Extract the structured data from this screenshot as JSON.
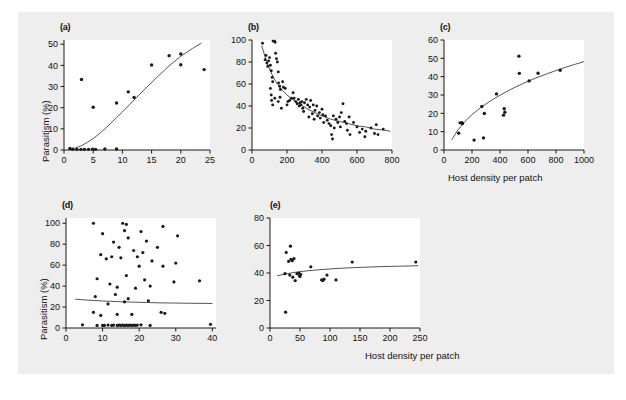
{
  "figure": {
    "background_color": "#eeeeee",
    "panel_background_color": "#ffffff",
    "point_color": "#1a1a1a",
    "curve_color": "#555555",
    "axis_color": "#1a1a1a",
    "shared_ylabel": "Parasitism (%)",
    "shared_xlabel": "Host density per patch"
  },
  "chart_data": [
    {
      "type": "scatter",
      "panel": "(a)",
      "title": "",
      "xlabel": "",
      "ylabel": "Parasitism (%)",
      "xlim": [
        0,
        25
      ],
      "ylim": [
        0,
        52
      ],
      "xticks": [
        0,
        5,
        10,
        15,
        20,
        25
      ],
      "yticks": [
        0,
        10,
        20,
        30,
        40,
        50
      ],
      "grid": false,
      "legend": "none",
      "points": [
        [
          1.0,
          0.7
        ],
        [
          1.5,
          0.4
        ],
        [
          2.2,
          0.3
        ],
        [
          2.9,
          0.3
        ],
        [
          3.5,
          0.3
        ],
        [
          4.2,
          0.3
        ],
        [
          4.9,
          0.4
        ],
        [
          5.4,
          0.3
        ],
        [
          7.0,
          0.5
        ],
        [
          9.0,
          0.5
        ],
        [
          3.0,
          33.3
        ],
        [
          5.0,
          20.2
        ],
        [
          9.0,
          22.2
        ],
        [
          11.0,
          27.5
        ],
        [
          12.0,
          24.8
        ],
        [
          15.0,
          40.2
        ],
        [
          18.0,
          44.6
        ],
        [
          20.0,
          45.4
        ],
        [
          20.0,
          40.3
        ],
        [
          24.0,
          38.0
        ]
      ],
      "fit_curve": [
        [
          1.0,
          0.4
        ],
        [
          2.0,
          1.0
        ],
        [
          3.0,
          2.1
        ],
        [
          4.0,
          3.6
        ],
        [
          5.0,
          5.4
        ],
        [
          6.0,
          7.6
        ],
        [
          7.0,
          10.0
        ],
        [
          8.0,
          12.6
        ],
        [
          9.0,
          15.3
        ],
        [
          10.0,
          18.0
        ],
        [
          12.0,
          23.6
        ],
        [
          14.0,
          29.2
        ],
        [
          16.0,
          34.6
        ],
        [
          18.0,
          39.8
        ],
        [
          20.0,
          44.3
        ],
        [
          22.0,
          48.0
        ],
        [
          23.5,
          50.5
        ]
      ]
    },
    {
      "type": "scatter",
      "panel": "(b)",
      "title": "",
      "xlabel": "",
      "ylabel": "",
      "xlim": [
        0,
        800
      ],
      "ylim": [
        0,
        100
      ],
      "xticks": [
        0,
        200,
        400,
        600,
        800
      ],
      "yticks": [
        0,
        20,
        40,
        60,
        80,
        100
      ],
      "grid": false,
      "legend": "none",
      "points": [
        [
          60,
          97
        ],
        [
          75,
          82
        ],
        [
          80,
          86
        ],
        [
          85,
          79
        ],
        [
          90,
          76
        ],
        [
          95,
          81
        ],
        [
          100,
          84
        ],
        [
          105,
          77
        ],
        [
          110,
          72
        ],
        [
          115,
          66
        ],
        [
          118,
          62
        ],
        [
          120,
          99
        ],
        [
          128,
          99
        ],
        [
          132,
          98
        ],
        [
          135,
          88
        ],
        [
          140,
          83
        ],
        [
          145,
          80
        ],
        [
          150,
          71
        ],
        [
          152,
          61
        ],
        [
          158,
          58
        ],
        [
          162,
          55
        ],
        [
          105,
          56
        ],
        [
          110,
          50
        ],
        [
          112,
          45
        ],
        [
          118,
          41
        ],
        [
          130,
          47
        ],
        [
          150,
          44
        ],
        [
          160,
          48
        ],
        [
          168,
          38
        ],
        [
          175,
          62
        ],
        [
          180,
          57
        ],
        [
          190,
          56
        ],
        [
          200,
          41
        ],
        [
          205,
          44
        ],
        [
          215,
          45
        ],
        [
          225,
          47
        ],
        [
          235,
          52
        ],
        [
          240,
          47
        ],
        [
          250,
          44
        ],
        [
          258,
          42
        ],
        [
          265,
          46
        ],
        [
          270,
          40
        ],
        [
          275,
          43
        ],
        [
          280,
          41
        ],
        [
          285,
          44
        ],
        [
          290,
          38
        ],
        [
          295,
          35
        ],
        [
          300,
          43
        ],
        [
          310,
          46
        ],
        [
          318,
          41
        ],
        [
          325,
          30
        ],
        [
          330,
          39
        ],
        [
          335,
          45
        ],
        [
          345,
          33
        ],
        [
          350,
          41
        ],
        [
          355,
          28
        ],
        [
          360,
          36
        ],
        [
          370,
          40
        ],
        [
          375,
          31
        ],
        [
          385,
          34
        ],
        [
          390,
          29
        ],
        [
          400,
          37
        ],
        [
          405,
          32
        ],
        [
          410,
          25
        ],
        [
          420,
          31
        ],
        [
          430,
          27
        ],
        [
          440,
          24
        ],
        [
          450,
          22
        ],
        [
          455,
          14
        ],
        [
          460,
          10
        ],
        [
          465,
          31
        ],
        [
          470,
          20
        ],
        [
          480,
          28
        ],
        [
          490,
          25
        ],
        [
          500,
          30
        ],
        [
          505,
          21
        ],
        [
          510,
          34
        ],
        [
          520,
          42
        ],
        [
          530,
          26
        ],
        [
          540,
          24
        ],
        [
          545,
          18
        ],
        [
          555,
          30
        ],
        [
          560,
          14
        ],
        [
          580,
          25
        ],
        [
          600,
          21
        ],
        [
          615,
          16
        ],
        [
          630,
          19
        ],
        [
          645,
          12
        ],
        [
          650,
          17
        ],
        [
          680,
          20
        ],
        [
          700,
          15
        ],
        [
          710,
          23
        ],
        [
          720,
          14
        ],
        [
          750,
          19
        ]
      ],
      "fit_curve": [
        [
          55,
          95
        ],
        [
          80,
          82
        ],
        [
          110,
          70
        ],
        [
          140,
          61
        ],
        [
          170,
          55
        ],
        [
          200,
          50
        ],
        [
          240,
          45
        ],
        [
          280,
          41
        ],
        [
          320,
          37
        ],
        [
          360,
          34
        ],
        [
          400,
          31
        ],
        [
          450,
          28
        ],
        [
          500,
          26
        ],
        [
          550,
          24
        ],
        [
          600,
          22
        ],
        [
          650,
          21
        ],
        [
          700,
          19
        ],
        [
          760,
          18
        ],
        [
          790,
          17
        ]
      ]
    },
    {
      "type": "scatter",
      "panel": "(c)",
      "title": "",
      "xlabel": "Host density per patch",
      "ylabel": "",
      "xlim": [
        0,
        1000
      ],
      "ylim": [
        0,
        60
      ],
      "xticks": [
        0,
        200,
        400,
        600,
        800,
        1000
      ],
      "yticks": [
        0,
        10,
        20,
        30,
        40,
        50,
        60
      ],
      "grid": false,
      "legend": "none",
      "points": [
        [
          105,
          9.2
        ],
        [
          115,
          14.8
        ],
        [
          128,
          14.9
        ],
        [
          132,
          14.4
        ],
        [
          215,
          5.4
        ],
        [
          270,
          23.7
        ],
        [
          282,
          6.6
        ],
        [
          288,
          19.9
        ],
        [
          375,
          30.6
        ],
        [
          425,
          19.0
        ],
        [
          430,
          22.5
        ],
        [
          435,
          20.6
        ],
        [
          535,
          51.2
        ],
        [
          538,
          41.8
        ],
        [
          608,
          37.7
        ],
        [
          672,
          41.9
        ],
        [
          830,
          43.5
        ]
      ],
      "fit_curve": [
        [
          55,
          5.5
        ],
        [
          100,
          11.0
        ],
        [
          150,
          15.6
        ],
        [
          200,
          19.3
        ],
        [
          260,
          23.0
        ],
        [
          330,
          26.7
        ],
        [
          400,
          29.9
        ],
        [
          480,
          33.2
        ],
        [
          560,
          36.1
        ],
        [
          650,
          39.1
        ],
        [
          740,
          41.7
        ],
        [
          840,
          44.4
        ],
        [
          930,
          46.6
        ],
        [
          1000,
          48.2
        ]
      ]
    },
    {
      "type": "scatter",
      "panel": "(d)",
      "title": "",
      "xlabel": "Host density per patch",
      "ylabel": "Parasitism (%)",
      "xlim": [
        0,
        41
      ],
      "ylim": [
        0,
        105
      ],
      "xticks": [
        0,
        10,
        20,
        30,
        40
      ],
      "yticks": [
        0,
        20,
        40,
        60,
        80,
        100
      ],
      "grid": false,
      "legend": "none",
      "points": [
        [
          7.5,
          100
        ],
        [
          15.5,
          100
        ],
        [
          16.5,
          99
        ],
        [
          20.5,
          92
        ],
        [
          26.5,
          97
        ],
        [
          10.0,
          90
        ],
        [
          16.0,
          93
        ],
        [
          17.0,
          86
        ],
        [
          22.0,
          83
        ],
        [
          30.5,
          88
        ],
        [
          13.0,
          82
        ],
        [
          14.5,
          77
        ],
        [
          18.5,
          74
        ],
        [
          21.0,
          72
        ],
        [
          25.0,
          77
        ],
        [
          9.5,
          70
        ],
        [
          12.5,
          68
        ],
        [
          15.0,
          67
        ],
        [
          19.5,
          68
        ],
        [
          23.5,
          64
        ],
        [
          30.0,
          62
        ],
        [
          11.0,
          66
        ],
        [
          20.0,
          59
        ],
        [
          26.5,
          59
        ],
        [
          36.5,
          45
        ],
        [
          8.5,
          47
        ],
        [
          16.5,
          50
        ],
        [
          21.5,
          46
        ],
        [
          29.5,
          44
        ],
        [
          12.0,
          42
        ],
        [
          14.0,
          39
        ],
        [
          19.0,
          38
        ],
        [
          23.0,
          40
        ],
        [
          8.0,
          30
        ],
        [
          13.5,
          32
        ],
        [
          17.0,
          28
        ],
        [
          22.5,
          26
        ],
        [
          11.5,
          23
        ],
        [
          16.0,
          25
        ],
        [
          26.0,
          15
        ],
        [
          27.0,
          14
        ],
        [
          7.5,
          15
        ],
        [
          9.5,
          12
        ],
        [
          14.0,
          13
        ],
        [
          18.0,
          13
        ],
        [
          4.5,
          3.0
        ],
        [
          8.5,
          2.5
        ],
        [
          10.0,
          2.5
        ],
        [
          10.5,
          2.5
        ],
        [
          11.5,
          2.8
        ],
        [
          12.5,
          2.5
        ],
        [
          13.0,
          2.8
        ],
        [
          14.0,
          2.5
        ],
        [
          14.5,
          2.8
        ],
        [
          15.0,
          2.5
        ],
        [
          15.5,
          2.8
        ],
        [
          16.0,
          2.5
        ],
        [
          16.5,
          2.8
        ],
        [
          17.0,
          2.5
        ],
        [
          17.5,
          2.8
        ],
        [
          18.0,
          2.5
        ],
        [
          18.5,
          2.8
        ],
        [
          19.0,
          2.5
        ],
        [
          19.5,
          2.8
        ],
        [
          20.5,
          3.0
        ],
        [
          23.0,
          2.5
        ],
        [
          39.5,
          3.5
        ]
      ],
      "fit_curve": [
        [
          2.5,
          27.5
        ],
        [
          6.0,
          26.6
        ],
        [
          10.0,
          25.8
        ],
        [
          14.0,
          25.2
        ],
        [
          18.0,
          24.7
        ],
        [
          22.0,
          24.3
        ],
        [
          26.0,
          24.0
        ],
        [
          30.0,
          23.8
        ],
        [
          34.0,
          23.6
        ],
        [
          38.0,
          23.5
        ],
        [
          40.0,
          23.4
        ]
      ]
    },
    {
      "type": "scatter",
      "panel": "(e)",
      "title": "",
      "xlabel": "",
      "ylabel": "",
      "xlim": [
        0,
        250
      ],
      "ylim": [
        0,
        80
      ],
      "xticks": [
        0,
        50,
        100,
        150,
        200,
        250
      ],
      "yticks": [
        0,
        20,
        40,
        60,
        80
      ],
      "grid": false,
      "legend": "none",
      "points": [
        [
          26,
          11.5
        ],
        [
          25,
          39.5
        ],
        [
          27,
          55.0
        ],
        [
          31,
          48.5
        ],
        [
          34,
          59.5
        ],
        [
          35,
          50.0
        ],
        [
          37,
          49.0
        ],
        [
          40,
          50.5
        ],
        [
          33,
          38.5
        ],
        [
          38,
          37.0
        ],
        [
          42,
          34.5
        ],
        [
          45,
          39.5
        ],
        [
          48,
          40.0
        ],
        [
          49,
          38.0
        ],
        [
          50,
          37.5
        ],
        [
          51,
          39.0
        ],
        [
          68,
          44.5
        ],
        [
          86,
          35.0
        ],
        [
          88,
          34.5
        ],
        [
          90,
          35.5
        ],
        [
          95,
          38.5
        ],
        [
          110,
          35.0
        ],
        [
          137,
          48.0
        ],
        [
          243,
          48.0
        ]
      ],
      "fit_curve": [
        [
          12,
          38.0
        ],
        [
          25,
          39.2
        ],
        [
          40,
          40.4
        ],
        [
          60,
          41.5
        ],
        [
          85,
          42.5
        ],
        [
          115,
          43.4
        ],
        [
          150,
          44.1
        ],
        [
          190,
          44.7
        ],
        [
          230,
          45.1
        ],
        [
          247,
          45.3
        ]
      ]
    }
  ]
}
